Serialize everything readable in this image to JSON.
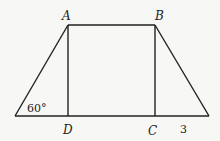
{
  "diagram": {
    "type": "isosceles trapezoid with altitudes",
    "points": {
      "A": "A",
      "B": "B",
      "C": "C",
      "D": "D"
    },
    "angle_label": "60°",
    "segment_label": "3",
    "colors": {
      "stroke": "#222222",
      "background": "#f7f7f5"
    }
  }
}
